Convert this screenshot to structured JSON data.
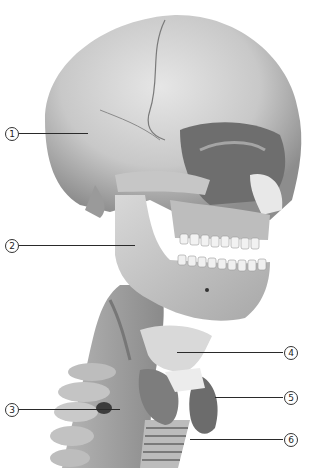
{
  "figure": {
    "background": "#ffffff",
    "bone_color": "#cfcfcf",
    "shadow_color": "#6a6a6a"
  },
  "callouts": [
    {
      "number": "1",
      "side": "left",
      "circle_x": 5,
      "y": 133,
      "line_x1": 19,
      "line_x2": 88
    },
    {
      "number": "2",
      "side": "left",
      "circle_x": 5,
      "y": 245,
      "line_x1": 19,
      "line_x2": 135
    },
    {
      "number": "3",
      "side": "left",
      "circle_x": 5,
      "y": 409,
      "line_x1": 19,
      "line_x2": 120
    },
    {
      "number": "4",
      "side": "right",
      "circle_x": 284,
      "y": 352,
      "line_x1": 177,
      "line_x2": 283
    },
    {
      "number": "5",
      "side": "right",
      "circle_x": 284,
      "y": 397,
      "line_x1": 215,
      "line_x2": 283
    },
    {
      "number": "6",
      "side": "right",
      "circle_x": 284,
      "y": 439,
      "line_x1": 190,
      "line_x2": 283
    }
  ]
}
